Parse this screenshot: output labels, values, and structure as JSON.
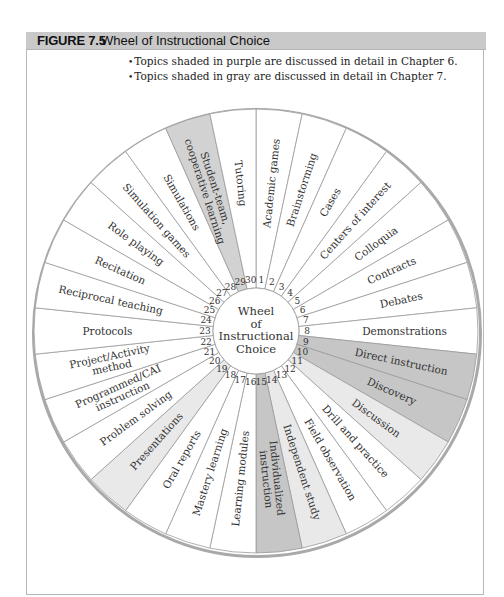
{
  "figure": {
    "number": "FIGURE 7.5",
    "title": "Wheel of Instructional Choice"
  },
  "legend": [
    "Topics shaded in purple are discussed in detail in Chapter 6.",
    "Topics shaded in gray are discussed in detail in Chapter 7."
  ],
  "wheel": {
    "center_label": [
      "Wheel",
      "of",
      "Instructional",
      "Choice"
    ],
    "colors": {
      "none": "#ffffff",
      "purple": "#c6c6c6",
      "gray_light": "#e9e9e9",
      "gray_mid": "#d2d2d2",
      "stroke": "#9a9a9a",
      "rim": "#a9a9a9"
    },
    "segments": [
      {
        "n": 1,
        "label": [
          "Academic games"
        ],
        "shade": "none"
      },
      {
        "n": 2,
        "label": [
          "Brainstorming"
        ],
        "shade": "none"
      },
      {
        "n": 3,
        "label": [
          "Cases"
        ],
        "shade": "none"
      },
      {
        "n": 4,
        "label": [
          "Centers of interest"
        ],
        "shade": "none"
      },
      {
        "n": 5,
        "label": [
          "Colloquia"
        ],
        "shade": "none"
      },
      {
        "n": 6,
        "label": [
          "Contracts"
        ],
        "shade": "none"
      },
      {
        "n": 7,
        "label": [
          "Debates"
        ],
        "shade": "none"
      },
      {
        "n": 8,
        "label": [
          "Demonstrations"
        ],
        "shade": "none"
      },
      {
        "n": 9,
        "label": [
          "Direct instruction"
        ],
        "shade": "purple"
      },
      {
        "n": 10,
        "label": [
          "Discovery"
        ],
        "shade": "purple"
      },
      {
        "n": 11,
        "label": [
          "Discussion"
        ],
        "shade": "gray_light"
      },
      {
        "n": 12,
        "label": [
          "Drill and practice"
        ],
        "shade": "none"
      },
      {
        "n": 13,
        "label": [
          "Field observation"
        ],
        "shade": "none"
      },
      {
        "n": 14,
        "label": [
          "Independent study"
        ],
        "shade": "gray_light"
      },
      {
        "n": 15,
        "label": [
          "Individualized",
          "instruction"
        ],
        "shade": "purple"
      },
      {
        "n": 16,
        "label": [
          "Learning modules"
        ],
        "shade": "none"
      },
      {
        "n": 17,
        "label": [
          "Mastery learning"
        ],
        "shade": "none"
      },
      {
        "n": 18,
        "label": [
          "Oral reports"
        ],
        "shade": "none"
      },
      {
        "n": 19,
        "label": [
          "Presentations"
        ],
        "shade": "gray_light"
      },
      {
        "n": 20,
        "label": [
          "Problem solving"
        ],
        "shade": "none"
      },
      {
        "n": 21,
        "label": [
          "Programmed/CAI",
          "instruction"
        ],
        "shade": "none"
      },
      {
        "n": 22,
        "label": [
          "Project/Activity",
          "method"
        ],
        "shade": "none"
      },
      {
        "n": 23,
        "label": [
          "Protocols"
        ],
        "shade": "none"
      },
      {
        "n": 24,
        "label": [
          "Reciprocal teaching"
        ],
        "shade": "none"
      },
      {
        "n": 25,
        "label": [
          "Recitation"
        ],
        "shade": "none"
      },
      {
        "n": 26,
        "label": [
          "Role playing"
        ],
        "shade": "none"
      },
      {
        "n": 27,
        "label": [
          "Simulation games"
        ],
        "shade": "none"
      },
      {
        "n": 28,
        "label": [
          "Simulations"
        ],
        "shade": "none"
      },
      {
        "n": 29,
        "label": [
          "Student-team,",
          "cooperative learning"
        ],
        "shade": "gray_mid"
      },
      {
        "n": 30,
        "label": [
          "Tutoring"
        ],
        "shade": "none"
      }
    ]
  }
}
